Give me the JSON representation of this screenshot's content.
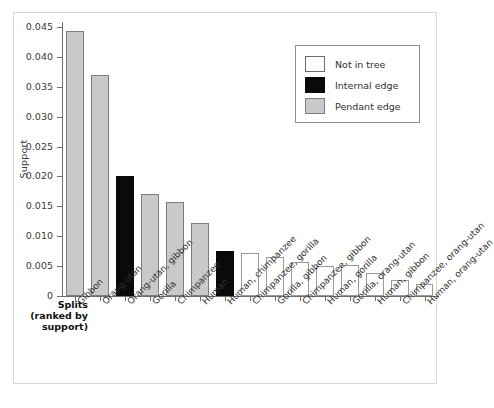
{
  "chart_data": {
    "type": "bar",
    "title": "",
    "xlabel": "Splits (ranked by support)",
    "ylabel": "Support",
    "ylim": [
      0,
      0.045
    ],
    "grid": false,
    "legend_position": "top-right",
    "ytick_labels": [
      "0",
      "0.005",
      "0.010",
      "0.015",
      "0.020",
      "0.025",
      "0.030",
      "0.035",
      "0.040",
      "0.045"
    ],
    "ytick_values": [
      0,
      0.005,
      0.01,
      0.015,
      0.02,
      0.025,
      0.03,
      0.035,
      0.04,
      0.045
    ],
    "categories": [
      "Gibbon",
      "Orang-utan",
      "Orang-utan, gibbon",
      "Gorilla",
      "Chimpanzee",
      "Human",
      "Human, chimpanzee",
      "Chimpanzee, gorilla",
      "Gorilla, gibbon",
      "Chimpanzee, gibbon",
      "Human, gorilla",
      "Gorilla, orang-utan",
      "Human, gibbon",
      "Chimpanzee, orang-utan",
      "Human, orang-utan"
    ],
    "values": [
      0.0443,
      0.037,
      0.0201,
      0.0171,
      0.0157,
      0.0122,
      0.0076,
      0.0072,
      0.0065,
      0.0057,
      0.0051,
      0.0052,
      0.0038,
      0.0026,
      0.002
    ],
    "categories_class": [
      "pendant",
      "pendant",
      "internal",
      "pendant",
      "pendant",
      "pendant",
      "internal",
      "notin",
      "notin",
      "notin",
      "notin",
      "notin",
      "notin",
      "notin",
      "notin"
    ]
  },
  "axis": {
    "y_title": "Support",
    "x_title_line1": "Splits",
    "x_title_line2": "(ranked by",
    "x_title_line3": "support)"
  },
  "legend": {
    "entries": [
      {
        "label": "Not in tree",
        "key": "notin",
        "color": "#ffffff"
      },
      {
        "label": "Internal edge",
        "key": "internal",
        "color": "#0a0a0a"
      },
      {
        "label": "Pendant edge",
        "key": "pendant",
        "color": "#c9c9c9"
      }
    ]
  },
  "colors": {
    "pendant": "#c9c9c9",
    "internal": "#0a0a0a",
    "not_in_tree": "#ffffff",
    "axis": "#6e6e6e",
    "text": "#2f2f2f"
  }
}
